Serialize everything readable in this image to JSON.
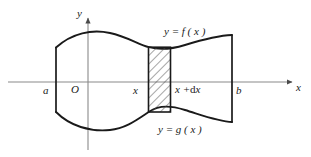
{
  "figure": {
    "axes": {
      "x_axis_label": "x",
      "y_axis_label": "y",
      "origin_label": "O",
      "x_axis_color": "#8a8a8a",
      "y_axis_color": "#8a8a8a"
    },
    "tick_labels": {
      "left_bound": "a",
      "right_bound": "b",
      "strip_left": "x",
      "strip_right": "x +dx",
      "strip_right_prefix": "x +",
      "strip_right_d": "d",
      "strip_right_suffix": "x"
    },
    "curve_labels": {
      "upper": "y = f ( x )",
      "lower": "y = g ( x )"
    },
    "curve_color": "#1a1a1a",
    "hatch_color": "#4d4d4d",
    "element": {
      "name": "differential-strip",
      "fill": "hatched",
      "left_at": "x",
      "right_at": "x +dx"
    }
  }
}
